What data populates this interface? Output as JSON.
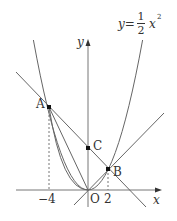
{
  "diagram": {
    "type": "coordinate-geometry",
    "curve_label": {
      "lhs": "y=",
      "num": "1",
      "den": "2",
      "var": "x",
      "exp": "2"
    },
    "axes": {
      "x_label": "x",
      "y_label": "y",
      "origin_label": "O"
    },
    "tick_labels": {
      "neg4": "−4",
      "pos2": "2"
    },
    "points": {
      "A": {
        "label": "A",
        "x": -4,
        "y": 8
      },
      "B": {
        "label": "B",
        "x": 2,
        "y": 2
      },
      "C": {
        "label": "C",
        "x": 0,
        "y": 4
      },
      "O": {
        "label": "O",
        "x": 0,
        "y": 0
      }
    },
    "lines": [
      "AB through C (y=-x+4)",
      "AO (y=-2x)",
      "OB (y=x)"
    ],
    "curves": [
      "y=1/2 x^2"
    ]
  }
}
